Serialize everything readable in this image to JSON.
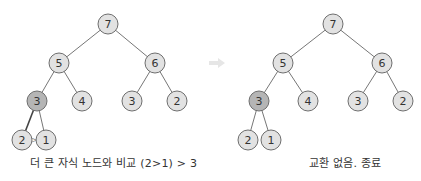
{
  "colors": {
    "node_fill": "#e2e2e2",
    "node_stroke": "#6e6e6e",
    "highlight_fill": "#b5b5b5",
    "edge": "#777777",
    "edge_active": "#444444",
    "arrow": "#e6e6e6",
    "text": "#333333"
  },
  "panels": [
    {
      "caption": "더 큰 자식 노드와 비교 (2>1) > 3",
      "nodes": [
        {
          "id": "a",
          "label": "7",
          "x": 108,
          "y": 24
        },
        {
          "id": "b",
          "label": "5",
          "x": 59,
          "y": 63
        },
        {
          "id": "c",
          "label": "6",
          "x": 155,
          "y": 63
        },
        {
          "id": "d",
          "label": "3",
          "x": 37,
          "y": 101,
          "highlight": true
        },
        {
          "id": "e",
          "label": "4",
          "x": 82,
          "y": 101
        },
        {
          "id": "f",
          "label": "3",
          "x": 132,
          "y": 101
        },
        {
          "id": "g",
          "label": "2",
          "x": 177,
          "y": 101
        },
        {
          "id": "h",
          "label": "2",
          "x": 22,
          "y": 140
        },
        {
          "id": "i",
          "label": "1",
          "x": 46,
          "y": 140
        }
      ],
      "edges": [
        [
          "a",
          "b"
        ],
        [
          "a",
          "c"
        ],
        [
          "b",
          "d"
        ],
        [
          "b",
          "e"
        ],
        [
          "c",
          "f"
        ],
        [
          "c",
          "g"
        ],
        [
          "d",
          "h",
          "active"
        ],
        [
          "d",
          "i"
        ]
      ],
      "compare_mark": {
        "text": ">",
        "x": 34,
        "y": 140
      }
    },
    {
      "caption": "교환 없음. 종료",
      "nodes": [
        {
          "id": "a",
          "label": "7",
          "x": 333,
          "y": 24
        },
        {
          "id": "b",
          "label": "5",
          "x": 283,
          "y": 63
        },
        {
          "id": "c",
          "label": "6",
          "x": 382,
          "y": 63
        },
        {
          "id": "d",
          "label": "3",
          "x": 259,
          "y": 101,
          "highlight": true
        },
        {
          "id": "e",
          "label": "4",
          "x": 308,
          "y": 101
        },
        {
          "id": "f",
          "label": "3",
          "x": 358,
          "y": 101
        },
        {
          "id": "g",
          "label": "2",
          "x": 403,
          "y": 101
        },
        {
          "id": "h",
          "label": "2",
          "x": 248,
          "y": 140
        },
        {
          "id": "i",
          "label": "1",
          "x": 271,
          "y": 140
        }
      ],
      "edges": [
        [
          "a",
          "b"
        ],
        [
          "a",
          "c"
        ],
        [
          "b",
          "d"
        ],
        [
          "b",
          "e"
        ],
        [
          "c",
          "f"
        ],
        [
          "c",
          "g"
        ],
        [
          "d",
          "h"
        ],
        [
          "d",
          "i"
        ]
      ]
    }
  ],
  "transition_arrow": {
    "icon": "right-arrow-icon",
    "x": 217,
    "y": 63
  }
}
